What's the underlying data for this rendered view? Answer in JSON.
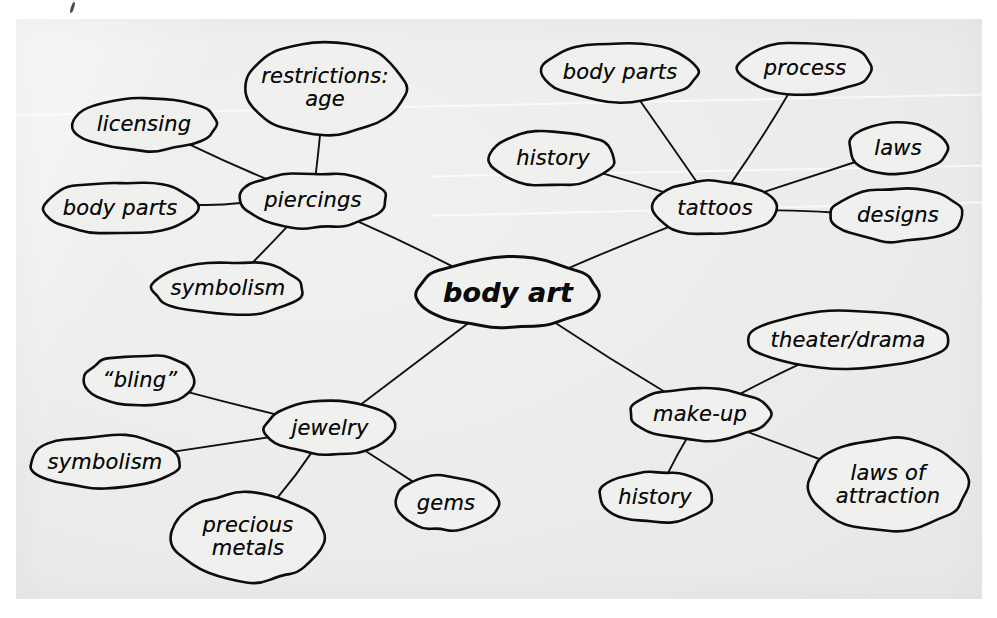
{
  "diagram": {
    "type": "mind-map",
    "title_node": "body art",
    "medium": "hand-drawn scanned worksheet",
    "ink_color": "#0d0d0d",
    "paper_color": "#ececeb",
    "nodes": [
      {
        "id": "body-art",
        "label": "body art",
        "cx": 508,
        "cy": 293,
        "rx": 92,
        "ry": 35,
        "level": "central"
      },
      {
        "id": "piercings",
        "label": "piercings",
        "cx": 313,
        "cy": 200,
        "rx": 74,
        "ry": 28,
        "level": "branch"
      },
      {
        "id": "licensing",
        "label": "licensing",
        "cx": 144,
        "cy": 124,
        "rx": 74,
        "ry": 27,
        "level": "leaf"
      },
      {
        "id": "restrictions-age",
        "label": "restrictions:\nage",
        "cx": 325,
        "cy": 88,
        "rx": 81,
        "ry": 47,
        "level": "leaf"
      },
      {
        "id": "piercings-body-parts",
        "label": "body parts",
        "cx": 120,
        "cy": 208,
        "rx": 78,
        "ry": 27,
        "level": "leaf"
      },
      {
        "id": "piercings-symbolism",
        "label": "symbolism",
        "cx": 228,
        "cy": 288,
        "rx": 76,
        "ry": 27,
        "level": "leaf"
      },
      {
        "id": "tattoos",
        "label": "tattoos",
        "cx": 715,
        "cy": 208,
        "rx": 64,
        "ry": 27,
        "level": "branch"
      },
      {
        "id": "tattoos-body-parts",
        "label": "body parts",
        "cx": 620,
        "cy": 72,
        "rx": 80,
        "ry": 29,
        "level": "leaf"
      },
      {
        "id": "process",
        "label": "process",
        "cx": 805,
        "cy": 68,
        "rx": 67,
        "ry": 27,
        "level": "leaf"
      },
      {
        "id": "tattoos-history",
        "label": "history",
        "cx": 553,
        "cy": 158,
        "rx": 63,
        "ry": 28,
        "level": "leaf"
      },
      {
        "id": "laws",
        "label": "laws",
        "cx": 898,
        "cy": 148,
        "rx": 50,
        "ry": 26,
        "level": "leaf"
      },
      {
        "id": "designs",
        "label": "designs",
        "cx": 898,
        "cy": 215,
        "rx": 67,
        "ry": 27,
        "level": "leaf"
      },
      {
        "id": "jewelry",
        "label": "jewelry",
        "cx": 330,
        "cy": 428,
        "rx": 65,
        "ry": 27,
        "level": "branch"
      },
      {
        "id": "bling",
        "label": "“bling”",
        "cx": 140,
        "cy": 380,
        "rx": 56,
        "ry": 26,
        "level": "leaf"
      },
      {
        "id": "jewelry-symbolism",
        "label": "symbolism",
        "cx": 105,
        "cy": 462,
        "rx": 76,
        "ry": 27,
        "level": "leaf"
      },
      {
        "id": "precious-metals",
        "label": "precious\nmetals",
        "cx": 248,
        "cy": 537,
        "rx": 76,
        "ry": 45,
        "level": "leaf"
      },
      {
        "id": "gems",
        "label": "gems",
        "cx": 446,
        "cy": 503,
        "rx": 52,
        "ry": 27,
        "level": "leaf"
      },
      {
        "id": "make-up",
        "label": "make-up",
        "cx": 700,
        "cy": 414,
        "rx": 70,
        "ry": 27,
        "level": "branch"
      },
      {
        "id": "theater-drama",
        "label": "theater/drama",
        "cx": 848,
        "cy": 340,
        "rx": 101,
        "ry": 29,
        "level": "leaf"
      },
      {
        "id": "makeup-history",
        "label": "history",
        "cx": 655,
        "cy": 497,
        "rx": 57,
        "ry": 26,
        "level": "leaf"
      },
      {
        "id": "laws-of-attraction",
        "label": "laws of\nattraction",
        "cx": 888,
        "cy": 485,
        "rx": 80,
        "ry": 47,
        "level": "leaf"
      }
    ],
    "edges": [
      {
        "from": "body-art",
        "to": "piercings"
      },
      {
        "from": "body-art",
        "to": "tattoos"
      },
      {
        "from": "body-art",
        "to": "jewelry"
      },
      {
        "from": "body-art",
        "to": "make-up"
      },
      {
        "from": "piercings",
        "to": "licensing"
      },
      {
        "from": "piercings",
        "to": "restrictions-age"
      },
      {
        "from": "piercings",
        "to": "piercings-body-parts"
      },
      {
        "from": "piercings",
        "to": "piercings-symbolism"
      },
      {
        "from": "tattoos",
        "to": "tattoos-body-parts"
      },
      {
        "from": "tattoos",
        "to": "process"
      },
      {
        "from": "tattoos",
        "to": "tattoos-history"
      },
      {
        "from": "tattoos",
        "to": "laws"
      },
      {
        "from": "tattoos",
        "to": "designs"
      },
      {
        "from": "jewelry",
        "to": "bling"
      },
      {
        "from": "jewelry",
        "to": "jewelry-symbolism"
      },
      {
        "from": "jewelry",
        "to": "precious-metals"
      },
      {
        "from": "jewelry",
        "to": "gems"
      },
      {
        "from": "make-up",
        "to": "theater-drama"
      },
      {
        "from": "make-up",
        "to": "makeup-history"
      },
      {
        "from": "make-up",
        "to": "laws-of-attraction"
      }
    ]
  }
}
